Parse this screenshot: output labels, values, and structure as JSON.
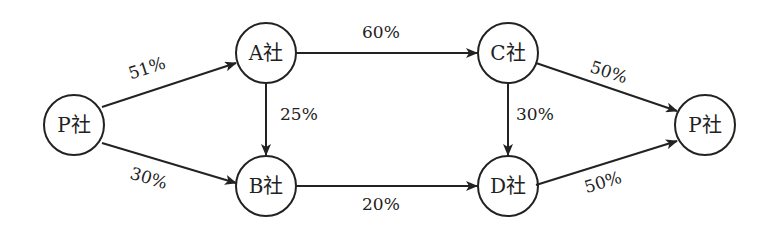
{
  "diagram": {
    "nodes": [
      {
        "id": "P_left",
        "label": "P社"
      },
      {
        "id": "A",
        "label": "A社"
      },
      {
        "id": "B",
        "label": "B社"
      },
      {
        "id": "C",
        "label": "C社"
      },
      {
        "id": "D",
        "label": "D社"
      },
      {
        "id": "P_right",
        "label": "P社"
      }
    ],
    "edges": [
      {
        "from": "P_left",
        "to": "A",
        "label": "51%"
      },
      {
        "from": "P_left",
        "to": "B",
        "label": "30%"
      },
      {
        "from": "A",
        "to": "B",
        "label": "25%"
      },
      {
        "from": "A",
        "to": "C",
        "label": "60%"
      },
      {
        "from": "B",
        "to": "D",
        "label": "20%"
      },
      {
        "from": "C",
        "to": "D",
        "label": "30%"
      },
      {
        "from": "C",
        "to": "P_right",
        "label": "50%"
      },
      {
        "from": "D",
        "to": "P_right",
        "label": "50%"
      }
    ],
    "colors": {
      "stroke": "#222222",
      "background": "#ffffff"
    }
  }
}
